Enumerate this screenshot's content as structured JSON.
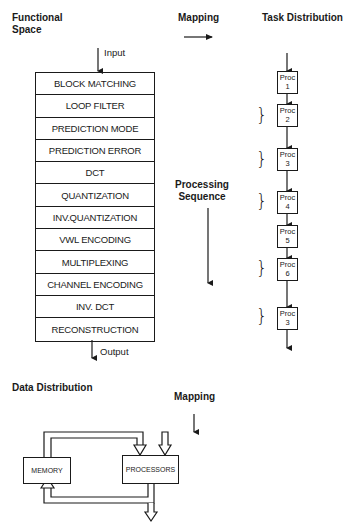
{
  "headings": {
    "functional_space": [
      "Functional",
      "Space"
    ],
    "mapping_top": "Mapping",
    "task_distribution": "Task Distribution",
    "processing_sequence": [
      "Processing",
      "Sequence"
    ],
    "data_distribution": "Data Distribution",
    "mapping_bottom": "Mapping"
  },
  "flow_labels": {
    "input": "Input",
    "output": "Output"
  },
  "functional_stack": [
    "BLOCK MATCHING",
    "LOOP FILTER",
    "PREDICTION MODE",
    "PREDICTION ERROR",
    "DCT",
    "QUANTIZATION",
    "INV.QUANTIZATION",
    "VWL ENCODING",
    "MULTIPLEXING",
    "CHANNEL ENCODING",
    "INV. DCT",
    "RECONSTRUCTION"
  ],
  "task_distribution": [
    {
      "label": "Proc",
      "num": "1"
    },
    {
      "label": "Proc",
      "num": "2"
    },
    {
      "label": "Proc",
      "num": "3"
    },
    {
      "label": "Proc",
      "num": "4"
    },
    {
      "label": "Proc",
      "num": "5"
    },
    {
      "label": "Proc",
      "num": "6"
    },
    {
      "label": "Proc",
      "num": "3"
    }
  ],
  "bracket_glyph": "}",
  "data_distribution_blocks": {
    "memory": "MEMORY",
    "processors": "PROCESSORS"
  },
  "colors": {
    "ink": "#1a1a1a",
    "background": "#ffffff"
  }
}
